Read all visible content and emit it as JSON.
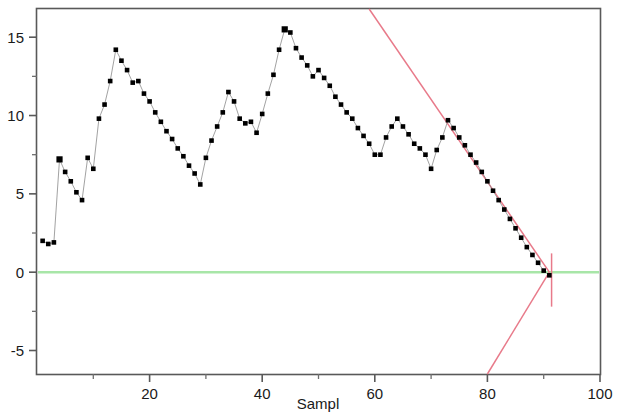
{
  "chart_data": {
    "type": "line",
    "title": "",
    "subtitle": "",
    "xlabel": "Sampl",
    "ylabel": "",
    "xlim": [
      0,
      100
    ],
    "ylim": [
      -6.5,
      16.8
    ],
    "grid": false,
    "legend": null,
    "x_ticks": [
      20,
      40,
      60,
      80,
      100
    ],
    "x_tick_labels": [
      "20",
      "40",
      "60",
      "80",
      "100"
    ],
    "x_minor_ticks": [
      10,
      30,
      50,
      70,
      90
    ],
    "y_ticks": [
      -5,
      0,
      5,
      10,
      15
    ],
    "y_tick_labels": [
      "-5",
      "0",
      "5",
      "10",
      "15"
    ],
    "y_minor_ticks": [
      -2.5,
      2.5,
      7.5,
      12.5
    ],
    "series": [
      {
        "name": "samples",
        "kind": "markers-with-line",
        "marker": "square",
        "color": "#000000",
        "line_color": "#8a8a8a",
        "x": [
          1,
          2,
          3,
          4,
          5,
          6,
          7,
          8,
          9,
          10,
          11,
          12,
          13,
          14,
          15,
          16,
          17,
          18,
          19,
          20,
          21,
          22,
          23,
          24,
          25,
          26,
          27,
          28,
          29,
          30,
          31,
          32,
          33,
          34,
          35,
          36,
          37,
          38,
          39,
          40,
          41,
          42,
          43,
          44,
          45,
          46,
          47,
          48,
          49,
          50,
          51,
          52,
          53,
          54,
          55,
          56,
          57,
          58,
          59,
          60,
          61,
          62,
          63,
          64,
          65,
          66,
          67,
          68,
          69,
          70,
          71,
          72,
          73,
          74,
          75,
          76,
          77,
          78,
          79,
          80,
          81,
          82,
          83,
          84,
          85,
          86,
          87,
          88,
          89,
          90,
          91
        ],
        "y": [
          2.0,
          1.8,
          1.9,
          7.2,
          6.4,
          5.8,
          5.1,
          4.6,
          7.3,
          6.6,
          9.8,
          10.7,
          12.2,
          14.2,
          13.5,
          12.9,
          12.1,
          12.2,
          11.4,
          10.9,
          10.2,
          9.6,
          9.0,
          8.5,
          7.9,
          7.4,
          6.8,
          6.3,
          5.6,
          7.3,
          8.4,
          9.3,
          10.2,
          11.5,
          10.9,
          9.8,
          9.5,
          9.6,
          8.9,
          10.1,
          11.4,
          12.6,
          14.2,
          15.5,
          15.3,
          14.3,
          13.7,
          13.2,
          12.5,
          12.9,
          12.4,
          11.9,
          11.2,
          10.7,
          10.2,
          9.8,
          9.2,
          8.7,
          8.2,
          7.5,
          7.5,
          8.6,
          9.3,
          9.8,
          9.3,
          8.8,
          8.2,
          7.9,
          7.5,
          6.6,
          7.8,
          8.6,
          9.7,
          9.2,
          8.6,
          8.1,
          7.5,
          7.0,
          6.4,
          5.8,
          5.2,
          4.6,
          4.0,
          3.4,
          2.8,
          2.2,
          1.6,
          1.1,
          0.6,
          0.1,
          -0.2
        ]
      }
    ],
    "reference_lines": [
      {
        "name": "zero-line",
        "type": "horizontal",
        "y": 0,
        "color": "#a8e6a8"
      },
      {
        "name": "upper-control-limit",
        "type": "segment",
        "color": "#e87a8a",
        "points": [
          [
            59,
            16.8
          ],
          [
            91,
            0.0
          ]
        ]
      },
      {
        "name": "lower-control-limit",
        "type": "segment",
        "color": "#e87a8a",
        "points": [
          [
            80,
            -6.5
          ],
          [
            91,
            0.0
          ]
        ]
      },
      {
        "name": "control-limit-vertical",
        "type": "segment",
        "color": "#e87a8a",
        "points": [
          [
            91.4,
            1.2
          ],
          [
            91.4,
            -2.2
          ]
        ]
      }
    ]
  },
  "axes": {
    "x_title": "Sampl",
    "y_title": ""
  }
}
